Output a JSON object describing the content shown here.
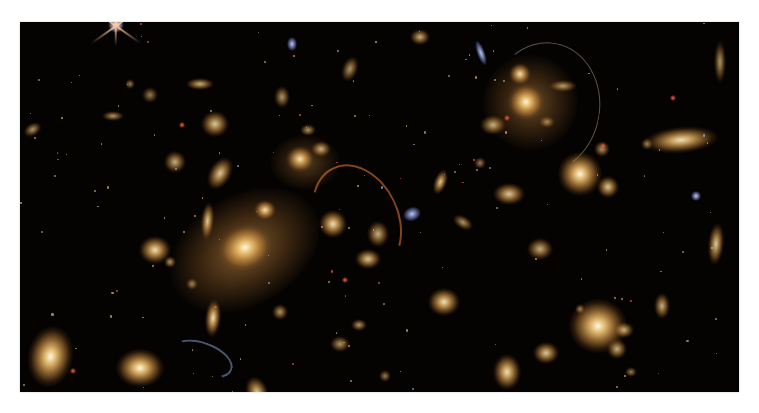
{
  "image": {
    "subject": "galaxy cluster deep-field photograph",
    "background_color": "#ffffff",
    "frame": {
      "x": 20,
      "y": 22,
      "width": 719,
      "height": 370,
      "color": "#050302"
    }
  },
  "colors": {
    "galaxy_core": "#fff6dc",
    "galaxy_mid": "#e8b060",
    "galaxy_halo": "#8a5a22",
    "blue_galaxy": "#8fa0e0",
    "red_dot": "#e04a30",
    "arc_orange": "#d8702a",
    "arc_blue": "#7890c0"
  },
  "halos": [
    {
      "x": 225,
      "y": 228,
      "w": 160,
      "h": 110,
      "rot": -30,
      "o": 0.55
    },
    {
      "x": 510,
      "y": 80,
      "w": 95,
      "h": 95,
      "rot": 0,
      "o": 0.45
    },
    {
      "x": 285,
      "y": 140,
      "w": 70,
      "h": 55,
      "rot": 0,
      "o": 0.35
    }
  ],
  "galaxies": [
    {
      "x": 225,
      "y": 225,
      "w": 34,
      "h": 28,
      "rot": -20,
      "b": 1.0
    },
    {
      "x": 245,
      "y": 188,
      "w": 14,
      "h": 12,
      "rot": 0,
      "b": 0.9
    },
    {
      "x": 280,
      "y": 137,
      "w": 18,
      "h": 16,
      "rot": 0,
      "b": 0.9
    },
    {
      "x": 301,
      "y": 127,
      "w": 12,
      "h": 10,
      "rot": 0,
      "b": 0.7
    },
    {
      "x": 187,
      "y": 199,
      "w": 8,
      "h": 24,
      "rot": 5,
      "b": 0.8
    },
    {
      "x": 313,
      "y": 202,
      "w": 18,
      "h": 18,
      "rot": 0,
      "b": 0.9
    },
    {
      "x": 135,
      "y": 228,
      "w": 20,
      "h": 18,
      "rot": 0,
      "b": 0.9
    },
    {
      "x": 195,
      "y": 102,
      "w": 18,
      "h": 16,
      "rot": 0,
      "b": 0.8
    },
    {
      "x": 200,
      "y": 152,
      "w": 14,
      "h": 22,
      "rot": 30,
      "b": 0.8
    },
    {
      "x": 155,
      "y": 140,
      "w": 14,
      "h": 14,
      "rot": 0,
      "b": 0.7
    },
    {
      "x": 180,
      "y": 62,
      "w": 18,
      "h": 8,
      "rot": 0,
      "b": 0.7
    },
    {
      "x": 330,
      "y": 47,
      "w": 10,
      "h": 16,
      "rot": 20,
      "b": 0.6
    },
    {
      "x": 358,
      "y": 212,
      "w": 14,
      "h": 16,
      "rot": 0,
      "b": 0.7
    },
    {
      "x": 348,
      "y": 237,
      "w": 16,
      "h": 12,
      "rot": 0,
      "b": 0.8
    },
    {
      "x": 13,
      "y": 107,
      "w": 12,
      "h": 8,
      "rot": -30,
      "b": 0.6
    },
    {
      "x": 93,
      "y": 94,
      "w": 14,
      "h": 6,
      "rot": 0,
      "b": 0.6
    },
    {
      "x": 110,
      "y": 62,
      "w": 6,
      "h": 6,
      "rot": 0,
      "b": 0.5
    },
    {
      "x": 262,
      "y": 75,
      "w": 10,
      "h": 14,
      "rot": 0,
      "b": 0.6
    },
    {
      "x": 288,
      "y": 108,
      "w": 10,
      "h": 8,
      "rot": 0,
      "b": 0.6
    },
    {
      "x": 130,
      "y": 73,
      "w": 10,
      "h": 10,
      "rot": 0,
      "b": 0.5
    },
    {
      "x": 150,
      "y": 240,
      "w": 8,
      "h": 8,
      "rot": 0,
      "b": 0.6
    },
    {
      "x": 172,
      "y": 262,
      "w": 8,
      "h": 8,
      "rot": 0,
      "b": 0.5
    },
    {
      "x": 30,
      "y": 334,
      "w": 28,
      "h": 38,
      "rot": 10,
      "b": 1.0
    },
    {
      "x": 120,
      "y": 346,
      "w": 30,
      "h": 24,
      "rot": 0,
      "b": 1.0
    },
    {
      "x": 193,
      "y": 296,
      "w": 10,
      "h": 24,
      "rot": 5,
      "b": 0.9
    },
    {
      "x": 237,
      "y": 370,
      "w": 14,
      "h": 20,
      "rot": -20,
      "b": 0.8
    },
    {
      "x": 260,
      "y": 290,
      "w": 10,
      "h": 10,
      "rot": 0,
      "b": 0.6
    },
    {
      "x": 320,
      "y": 322,
      "w": 12,
      "h": 10,
      "rot": 0,
      "b": 0.6
    },
    {
      "x": 506,
      "y": 80,
      "w": 22,
      "h": 22,
      "rot": 0,
      "b": 1.0
    },
    {
      "x": 500,
      "y": 52,
      "w": 14,
      "h": 14,
      "rot": 0,
      "b": 0.9
    },
    {
      "x": 473,
      "y": 103,
      "w": 16,
      "h": 12,
      "rot": 0,
      "b": 0.7
    },
    {
      "x": 527,
      "y": 100,
      "w": 10,
      "h": 8,
      "rot": 0,
      "b": 0.5
    },
    {
      "x": 460,
      "y": 141,
      "w": 8,
      "h": 8,
      "rot": 0,
      "b": 0.5
    },
    {
      "x": 400,
      "y": 15,
      "w": 12,
      "h": 10,
      "rot": 0,
      "b": 0.7
    },
    {
      "x": 543,
      "y": 64,
      "w": 18,
      "h": 8,
      "rot": 0,
      "b": 0.6
    },
    {
      "x": 560,
      "y": 152,
      "w": 28,
      "h": 28,
      "rot": 0,
      "b": 1.0
    },
    {
      "x": 588,
      "y": 165,
      "w": 14,
      "h": 14,
      "rot": 0,
      "b": 0.8
    },
    {
      "x": 582,
      "y": 127,
      "w": 10,
      "h": 10,
      "rot": 0,
      "b": 0.6
    },
    {
      "x": 661,
      "y": 118,
      "w": 46,
      "h": 16,
      "rot": -5,
      "b": 0.9
    },
    {
      "x": 627,
      "y": 122,
      "w": 8,
      "h": 8,
      "rot": 0,
      "b": 0.5
    },
    {
      "x": 489,
      "y": 172,
      "w": 20,
      "h": 14,
      "rot": 0,
      "b": 0.8
    },
    {
      "x": 420,
      "y": 160,
      "w": 8,
      "h": 16,
      "rot": 20,
      "b": 0.8
    },
    {
      "x": 443,
      "y": 200,
      "w": 14,
      "h": 8,
      "rot": 30,
      "b": 0.6
    },
    {
      "x": 520,
      "y": 227,
      "w": 16,
      "h": 14,
      "rot": 0,
      "b": 0.7
    },
    {
      "x": 696,
      "y": 222,
      "w": 10,
      "h": 26,
      "rot": 5,
      "b": 0.8
    },
    {
      "x": 424,
      "y": 280,
      "w": 20,
      "h": 18,
      "rot": 0,
      "b": 0.9
    },
    {
      "x": 578,
      "y": 304,
      "w": 36,
      "h": 34,
      "rot": 0,
      "b": 1.0
    },
    {
      "x": 604,
      "y": 308,
      "w": 12,
      "h": 10,
      "rot": 0,
      "b": 0.7
    },
    {
      "x": 597,
      "y": 327,
      "w": 12,
      "h": 12,
      "rot": 0,
      "b": 0.7
    },
    {
      "x": 642,
      "y": 284,
      "w": 10,
      "h": 16,
      "rot": 0,
      "b": 0.7
    },
    {
      "x": 526,
      "y": 331,
      "w": 16,
      "h": 14,
      "rot": 0,
      "b": 0.8
    },
    {
      "x": 487,
      "y": 350,
      "w": 18,
      "h": 22,
      "rot": 0,
      "b": 0.9
    },
    {
      "x": 611,
      "y": 350,
      "w": 8,
      "h": 6,
      "rot": 0,
      "b": 0.5
    },
    {
      "x": 560,
      "y": 287,
      "w": 6,
      "h": 6,
      "rot": 0,
      "b": 0.5
    },
    {
      "x": 700,
      "y": 40,
      "w": 8,
      "h": 26,
      "rot": 0,
      "b": 0.6
    },
    {
      "x": 339,
      "y": 303,
      "w": 10,
      "h": 8,
      "rot": 0,
      "b": 0.6
    },
    {
      "x": 365,
      "y": 354,
      "w": 8,
      "h": 8,
      "rot": 0,
      "b": 0.5
    }
  ],
  "blue_galaxies": [
    {
      "x": 392,
      "y": 192,
      "w": 18,
      "h": 14,
      "rot": -20
    },
    {
      "x": 676,
      "y": 174,
      "w": 10,
      "h": 10,
      "rot": 0
    },
    {
      "x": 461,
      "y": 31,
      "w": 8,
      "h": 26,
      "rot": -20
    },
    {
      "x": 272,
      "y": 22,
      "w": 10,
      "h": 14,
      "rot": 0
    }
  ],
  "red_dots": [
    {
      "x": 162,
      "y": 103
    },
    {
      "x": 325,
      "y": 258
    },
    {
      "x": 583,
      "y": 124
    },
    {
      "x": 53,
      "y": 349
    },
    {
      "x": 653,
      "y": 76
    },
    {
      "x": 487,
      "y": 96
    }
  ],
  "stars": [
    {
      "x": 96,
      "y": 3,
      "size": 10
    }
  ],
  "arcs": [
    {
      "x": 295,
      "y": 140,
      "w": 80,
      "h": 110,
      "rot": -25,
      "color": "#d8702a",
      "width": 2
    },
    {
      "x": 468,
      "y": 20,
      "w": 110,
      "h": 130,
      "rot": 10,
      "color": "#9a8870",
      "width": 1
    },
    {
      "x": 150,
      "y": 320,
      "w": 60,
      "h": 30,
      "rot": 20,
      "color": "#7890c0",
      "width": 2
    }
  ]
}
